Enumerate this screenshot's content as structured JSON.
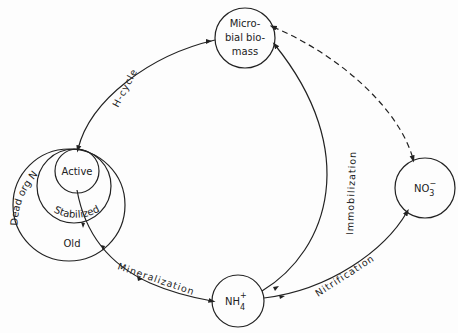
{
  "diagram": {
    "type": "nitrogen-cycle",
    "colors": {
      "ink": "#222222",
      "background": "#fdfdfd"
    },
    "nodes": {
      "microbial_biomass": {
        "lines": [
          "Micro-",
          "bial bio-",
          "mass"
        ]
      },
      "nitrate": {
        "base": "NO",
        "sub": "3",
        "sup": "−"
      },
      "ammonium": {
        "base": "NH",
        "sub": "4",
        "sup": "+"
      },
      "dead_org_n": {
        "label": "Dead org N",
        "pools": {
          "active": "Active",
          "stabilized": "Stabilized",
          "old": "Old"
        }
      }
    },
    "edges": {
      "h_cycle": "H-cycle",
      "immobilization": "Immobilization",
      "mineralization": "Mineralization",
      "nitrification": "Nitrification"
    }
  }
}
